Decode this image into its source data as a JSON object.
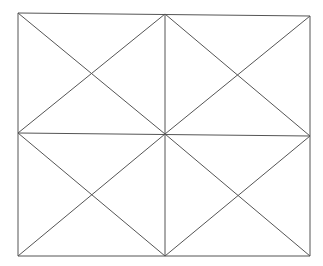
{
  "diagram": {
    "stroke_color": "#555555",
    "cropped_caption": "",
    "rect": {
      "x1": 18,
      "y1": 13,
      "x2": 310,
      "y2": 256
    },
    "center": {
      "x": 165,
      "y": 134
    }
  }
}
